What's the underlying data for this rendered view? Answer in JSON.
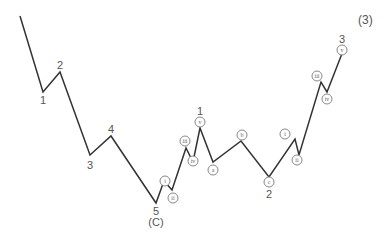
{
  "degree_label": "(3)",
  "line_color": "#333333",
  "points": [
    [
      20,
      16
    ],
    [
      43,
      92
    ],
    [
      60,
      72
    ],
    [
      90,
      155
    ],
    [
      111,
      136
    ],
    [
      156,
      203
    ],
    [
      164,
      181
    ],
    [
      172,
      190
    ],
    [
      186,
      148
    ],
    [
      193,
      162
    ],
    [
      200,
      128
    ],
    [
      213,
      162
    ],
    [
      241,
      141
    ],
    [
      269,
      177
    ],
    [
      295,
      139
    ],
    [
      299,
      155
    ],
    [
      321,
      82
    ],
    [
      327,
      92
    ],
    [
      343,
      51
    ]
  ],
  "labels": [
    {
      "text": "1",
      "x": 43,
      "y": 100,
      "type": "plain"
    },
    {
      "text": "2",
      "x": 60,
      "y": 65,
      "type": "plain"
    },
    {
      "text": "3",
      "x": 90,
      "y": 165,
      "type": "plain"
    },
    {
      "text": "4",
      "x": 111,
      "y": 129,
      "type": "plain"
    },
    {
      "text": "5",
      "x": 156,
      "y": 211,
      "type": "plain"
    },
    {
      "text": "(C)",
      "x": 156,
      "y": 222,
      "type": "plain"
    },
    {
      "text": "i",
      "x": 165,
      "y": 181,
      "type": "circle"
    },
    {
      "text": "ii",
      "x": 173,
      "y": 198,
      "type": "circle"
    },
    {
      "text": "iii",
      "x": 185,
      "y": 141,
      "type": "circle"
    },
    {
      "text": "iv",
      "x": 193,
      "y": 161,
      "type": "circle"
    },
    {
      "text": "v",
      "x": 200,
      "y": 122,
      "type": "circle"
    },
    {
      "text": "1",
      "x": 200,
      "y": 111,
      "type": "plain"
    },
    {
      "text": "a",
      "x": 213,
      "y": 170,
      "type": "circle"
    },
    {
      "text": "b",
      "x": 242,
      "y": 135,
      "type": "circle"
    },
    {
      "text": "c",
      "x": 269,
      "y": 182,
      "type": "circle"
    },
    {
      "text": "2",
      "x": 269,
      "y": 194,
      "type": "plain"
    },
    {
      "text": "i",
      "x": 285,
      "y": 134,
      "type": "circle"
    },
    {
      "text": "ii",
      "x": 297,
      "y": 160,
      "type": "circle"
    },
    {
      "text": "iii",
      "x": 317,
      "y": 76,
      "type": "circle"
    },
    {
      "text": "iv",
      "x": 327,
      "y": 99,
      "type": "circle"
    },
    {
      "text": "v",
      "x": 342,
      "y": 50,
      "type": "circle"
    },
    {
      "text": "3",
      "x": 342,
      "y": 39,
      "type": "plain"
    }
  ]
}
